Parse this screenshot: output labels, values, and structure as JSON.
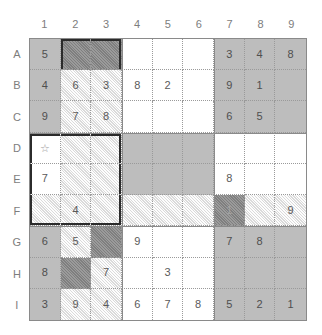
{
  "puzzle": {
    "title": "sudoku-style lettered grid",
    "column_headers": [
      "1",
      "2",
      "3",
      "4",
      "5",
      "6",
      "7",
      "8",
      "9"
    ],
    "row_headers": [
      "A",
      "B",
      "C",
      "D",
      "E",
      "F",
      "G",
      "H",
      "I"
    ],
    "palette": {
      "white": "#ffffff",
      "light_hatch": "#efefef",
      "mid_gray": "#bdbdbd",
      "dark_gray": "#8d8d8d",
      "grid_line": "#9a9a9a",
      "emphasis_line": "#2b2b2b",
      "text": "#5a5a5a",
      "header_text": "#7d7d7d"
    },
    "star_symbol": "☆",
    "rows": [
      {
        "label": "A",
        "cells": [
          {
            "id": "A1",
            "value": "5",
            "fill": "mid",
            "edges": ""
          },
          {
            "id": "A2",
            "value": "",
            "fill": "dark",
            "edges": "tl"
          },
          {
            "id": "A3",
            "value": "",
            "fill": "dark",
            "edges": "tr"
          },
          {
            "id": "A4",
            "value": "",
            "fill": "white",
            "edges": ""
          },
          {
            "id": "A5",
            "value": "",
            "fill": "white",
            "edges": ""
          },
          {
            "id": "A6",
            "value": "",
            "fill": "white",
            "edges": ""
          },
          {
            "id": "A7",
            "value": "3",
            "fill": "mid",
            "edges": ""
          },
          {
            "id": "A8",
            "value": "4",
            "fill": "mid",
            "edges": ""
          },
          {
            "id": "A9",
            "value": "8",
            "fill": "mid",
            "edges": ""
          }
        ]
      },
      {
        "label": "B",
        "cells": [
          {
            "id": "B1",
            "value": "4",
            "fill": "mid",
            "edges": ""
          },
          {
            "id": "B2",
            "value": "6",
            "fill": "light",
            "edges": ""
          },
          {
            "id": "B3",
            "value": "3",
            "fill": "light",
            "edges": ""
          },
          {
            "id": "B4",
            "value": "8",
            "fill": "white",
            "edges": ""
          },
          {
            "id": "B5",
            "value": "2",
            "fill": "white",
            "edges": ""
          },
          {
            "id": "B6",
            "value": "",
            "fill": "white",
            "edges": ""
          },
          {
            "id": "B7",
            "value": "9",
            "fill": "mid",
            "edges": ""
          },
          {
            "id": "B8",
            "value": "1",
            "fill": "mid",
            "edges": ""
          },
          {
            "id": "B9",
            "value": "",
            "fill": "mid",
            "edges": ""
          }
        ]
      },
      {
        "label": "C",
        "cells": [
          {
            "id": "C1",
            "value": "9",
            "fill": "mid",
            "edges": ""
          },
          {
            "id": "C2",
            "value": "7",
            "fill": "light",
            "edges": ""
          },
          {
            "id": "C3",
            "value": "8",
            "fill": "light",
            "edges": ""
          },
          {
            "id": "C4",
            "value": "",
            "fill": "white",
            "edges": ""
          },
          {
            "id": "C5",
            "value": "",
            "fill": "white",
            "edges": ""
          },
          {
            "id": "C6",
            "value": "",
            "fill": "white",
            "edges": ""
          },
          {
            "id": "C7",
            "value": "6",
            "fill": "mid",
            "edges": ""
          },
          {
            "id": "C8",
            "value": "5",
            "fill": "mid",
            "edges": ""
          },
          {
            "id": "C9",
            "value": "",
            "fill": "mid",
            "edges": ""
          }
        ]
      },
      {
        "label": "D",
        "cells": [
          {
            "id": "D1",
            "value": "",
            "fill": "white",
            "edges": "tl",
            "star": true
          },
          {
            "id": "D2",
            "value": "",
            "fill": "light",
            "edges": "t"
          },
          {
            "id": "D3",
            "value": "",
            "fill": "light",
            "edges": "tr"
          },
          {
            "id": "D4",
            "value": "",
            "fill": "mid",
            "edges": ""
          },
          {
            "id": "D5",
            "value": "",
            "fill": "mid",
            "edges": ""
          },
          {
            "id": "D6",
            "value": "",
            "fill": "mid",
            "edges": ""
          },
          {
            "id": "D7",
            "value": "",
            "fill": "white",
            "edges": ""
          },
          {
            "id": "D8",
            "value": "",
            "fill": "white",
            "edges": ""
          },
          {
            "id": "D9",
            "value": "",
            "fill": "white",
            "edges": ""
          }
        ]
      },
      {
        "label": "E",
        "cells": [
          {
            "id": "E1",
            "value": "7",
            "fill": "white",
            "edges": "l"
          },
          {
            "id": "E2",
            "value": "",
            "fill": "light",
            "edges": ""
          },
          {
            "id": "E3",
            "value": "",
            "fill": "light",
            "edges": "r"
          },
          {
            "id": "E4",
            "value": "",
            "fill": "mid",
            "edges": ""
          },
          {
            "id": "E5",
            "value": "",
            "fill": "mid",
            "edges": ""
          },
          {
            "id": "E6",
            "value": "",
            "fill": "mid",
            "edges": ""
          },
          {
            "id": "E7",
            "value": "8",
            "fill": "white",
            "edges": ""
          },
          {
            "id": "E8",
            "value": "",
            "fill": "white",
            "edges": ""
          },
          {
            "id": "E9",
            "value": "",
            "fill": "white",
            "edges": ""
          }
        ]
      },
      {
        "label": "F",
        "cells": [
          {
            "id": "F1",
            "value": "",
            "fill": "light",
            "edges": "bl"
          },
          {
            "id": "F2",
            "value": "4",
            "fill": "light",
            "edges": "b"
          },
          {
            "id": "F3",
            "value": "",
            "fill": "light",
            "edges": "br"
          },
          {
            "id": "F4",
            "value": "",
            "fill": "light",
            "edges": ""
          },
          {
            "id": "F5",
            "value": "",
            "fill": "light",
            "edges": ""
          },
          {
            "id": "F6",
            "value": "",
            "fill": "light",
            "edges": ""
          },
          {
            "id": "F7",
            "value": "1",
            "fill": "dark",
            "edges": ""
          },
          {
            "id": "F8",
            "value": "",
            "fill": "light",
            "edges": ""
          },
          {
            "id": "F9",
            "value": "9",
            "fill": "light",
            "edges": ""
          }
        ]
      },
      {
        "label": "G",
        "cells": [
          {
            "id": "G1",
            "value": "6",
            "fill": "mid",
            "edges": ""
          },
          {
            "id": "G2",
            "value": "5",
            "fill": "light",
            "edges": ""
          },
          {
            "id": "G3",
            "value": "",
            "fill": "dark",
            "edges": ""
          },
          {
            "id": "G4",
            "value": "9",
            "fill": "white",
            "edges": ""
          },
          {
            "id": "G5",
            "value": "",
            "fill": "white",
            "edges": ""
          },
          {
            "id": "G6",
            "value": "",
            "fill": "white",
            "edges": ""
          },
          {
            "id": "G7",
            "value": "7",
            "fill": "mid",
            "edges": ""
          },
          {
            "id": "G8",
            "value": "8",
            "fill": "mid",
            "edges": ""
          },
          {
            "id": "G9",
            "value": "",
            "fill": "mid",
            "edges": ""
          }
        ]
      },
      {
        "label": "H",
        "cells": [
          {
            "id": "H1",
            "value": "8",
            "fill": "mid",
            "edges": ""
          },
          {
            "id": "H2",
            "value": "",
            "fill": "dark",
            "edges": ""
          },
          {
            "id": "H3",
            "value": "7",
            "fill": "light",
            "edges": ""
          },
          {
            "id": "H4",
            "value": "",
            "fill": "white",
            "edges": ""
          },
          {
            "id": "H5",
            "value": "3",
            "fill": "white",
            "edges": ""
          },
          {
            "id": "H6",
            "value": "",
            "fill": "white",
            "edges": ""
          },
          {
            "id": "H7",
            "value": "",
            "fill": "mid",
            "edges": ""
          },
          {
            "id": "H8",
            "value": "",
            "fill": "mid",
            "edges": ""
          },
          {
            "id": "H9",
            "value": "",
            "fill": "mid",
            "edges": ""
          }
        ]
      },
      {
        "label": "I",
        "cells": [
          {
            "id": "I1",
            "value": "3",
            "fill": "mid",
            "edges": ""
          },
          {
            "id": "I2",
            "value": "9",
            "fill": "light",
            "edges": ""
          },
          {
            "id": "I3",
            "value": "4",
            "fill": "light",
            "edges": ""
          },
          {
            "id": "I4",
            "value": "6",
            "fill": "white",
            "edges": ""
          },
          {
            "id": "I5",
            "value": "7",
            "fill": "white",
            "edges": ""
          },
          {
            "id": "I6",
            "value": "8",
            "fill": "white",
            "edges": ""
          },
          {
            "id": "I7",
            "value": "5",
            "fill": "mid",
            "edges": ""
          },
          {
            "id": "I8",
            "value": "2",
            "fill": "mid",
            "edges": ""
          },
          {
            "id": "I9",
            "value": "1",
            "fill": "mid",
            "edges": ""
          }
        ]
      }
    ]
  }
}
